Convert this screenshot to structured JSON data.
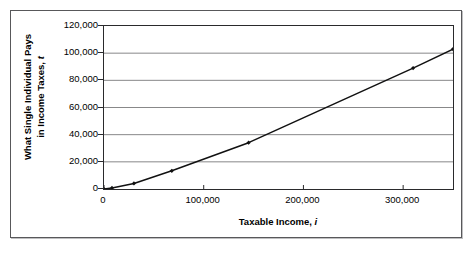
{
  "chart_data": {
    "type": "line",
    "title": "",
    "xlabel": "Taxable Income, i",
    "xlabel_plain": "Taxable Income,",
    "xlabel_var": "i",
    "ylabel": "What Single Individual Pays in Income Taxes, t",
    "ylabel_line1": "What Single Individual Pays",
    "ylabel_line2_plain": "in Income Taxes,",
    "ylabel_line2_var": "t",
    "xlim": [
      0,
      350000
    ],
    "ylim": [
      0,
      120000
    ],
    "xticks": [
      0,
      100000,
      200000,
      300000
    ],
    "xticklabels": [
      "0",
      "100,000",
      "200,000",
      "300,000"
    ],
    "yticks": [
      0,
      20000,
      40000,
      60000,
      80000,
      100000,
      120000
    ],
    "yticklabels": [
      "0",
      "20,000",
      "40,000",
      "60,000",
      "80,000",
      "100,000",
      "120,000"
    ],
    "grid": "horizontal",
    "gridcolor": "#7a7a7c",
    "linecolor": "#111111",
    "marker": "diamond",
    "series": [
      {
        "name": "Income tax owed",
        "x": [
          0,
          8000,
          30000,
          68000,
          145000,
          310000,
          350000
        ],
        "y": [
          0,
          800,
          4100,
          13400,
          34100,
          89000,
          103000
        ]
      }
    ]
  },
  "figure": {
    "border_color": "#58585a",
    "background": "#ffffff"
  }
}
